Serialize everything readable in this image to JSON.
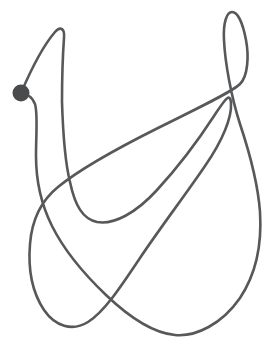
{
  "figure": {
    "kind": "closed-loop-curve-with-start-marker",
    "background_color": "#ffffff",
    "canvas": {
      "width": 276,
      "height": 345
    },
    "curve": {
      "name": "tangled-closed-curve",
      "stroke_color": "#57585a",
      "stroke_width": 2.6,
      "fill": "none",
      "closed": true,
      "self_intersections": 6,
      "path": "M 21 93 C 30 72 42 47 55 32 C 60 26 65 28 64 38 C 63 52 62 78 62 102 C 63 134 66 166 70 182 C 75 206 83 219 97 222 C 114 225 136 213 157 190 C 180 165 201 136 214 116 C 224 101 230 91 231 103 C 232 117 223 140 205 166 C 186 194 160 228 140 258 C 120 288 104 312 88 322 C 72 332 55 326 44 310 C 32 292 28 268 30 244 C 32 218 42 200 58 187 C 80 169 118 148 158 128 C 198 108 232 92 240 84 C 248 76 249 56 246 40 C 243 24 238 12 232 12 C 227 12 223 22 224 40 C 225 62 231 96 240 124 C 250 154 258 184 260 212 C 262 244 256 274 240 298 C 222 324 196 337 175 335 C 152 333 128 316 106 295 C 84 274 64 250 52 226 C 40 202 36 178 36 156 C 36 134 38 114 35 104 C 32 96 27 94 21 93 Z"
    },
    "marker": {
      "name": "start-point-dot",
      "shape": "circle",
      "fill_color": "#4a4b4d",
      "cx": 21,
      "cy": 93,
      "r": 8.5
    }
  }
}
